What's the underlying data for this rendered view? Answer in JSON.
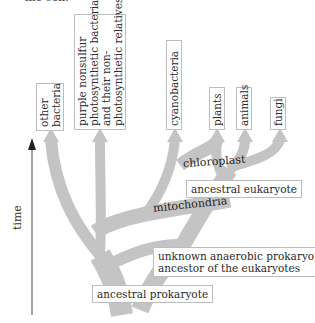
{
  "header": {
    "cut_text": "the cell."
  },
  "axis": {
    "label": "time",
    "direction": "up"
  },
  "colors": {
    "branch": "#c4c4c4",
    "box_border": "#bdbdbd",
    "text": "#2a2a2a",
    "axis": "#222222"
  },
  "leaves": [
    {
      "id": "other-bacteria",
      "label": "other\nbacteria"
    },
    {
      "id": "purple-nonsulfur",
      "label": "purple nonsulfur\nphotosynthetic bacteria\nand their non-\nphotosynthetic relatives"
    },
    {
      "id": "cyanobacteria",
      "label": "cyanobacteria"
    },
    {
      "id": "plants",
      "label": "plants"
    },
    {
      "id": "animals",
      "label": "animals"
    },
    {
      "id": "fungi",
      "label": "fungi"
    }
  ],
  "branch_labels": {
    "chloroplast": "chloroplast",
    "mitochondria": "mitochondria"
  },
  "nodes": {
    "ancestral_eukaryote": "ancestral eukaryote",
    "unknown_ancestor": "unknown anaerobic prokaryote\nancestor of the eukaryotes",
    "ancestral_prokaryote": "ancestral prokaryote"
  }
}
